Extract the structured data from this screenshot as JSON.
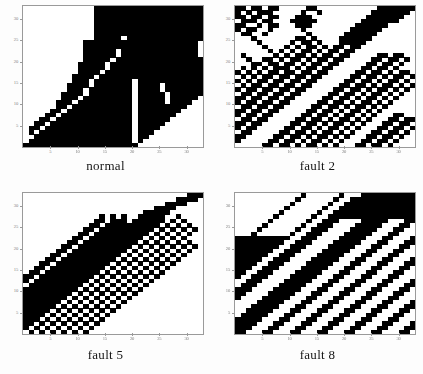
{
  "figure": {
    "name": "recurrence-plot-grid",
    "background": "#ffffff",
    "ink_color": "#000000",
    "axis_color": "#9a9a9a"
  },
  "panels": [
    {
      "caption": "normal",
      "key": "normal"
    },
    {
      "caption": "fault 2",
      "key": "fault2"
    },
    {
      "caption": "fault 5",
      "key": "fault5"
    },
    {
      "caption": "fault 8",
      "key": "fault8"
    }
  ],
  "axis": {
    "xticks": [
      5,
      10,
      15,
      20,
      25,
      30
    ],
    "yticks": [
      5,
      10,
      15,
      20,
      25,
      30
    ],
    "xlim": [
      0,
      33
    ],
    "ylim": [
      0,
      33
    ],
    "xlabel": "",
    "ylabel": "",
    "grid": false
  },
  "chart_data": [
    {
      "type": "heatmap",
      "title": "normal",
      "xlabel": "",
      "ylabel": "",
      "xlim": [
        0,
        33
      ],
      "ylim": [
        0,
        33
      ],
      "xticks": [
        5,
        10,
        15,
        20,
        25,
        30
      ],
      "yticks": [
        5,
        10,
        15,
        20,
        25,
        30
      ],
      "grid": false,
      "legend": "none",
      "colors": {
        "0": "#ffffff",
        "1": "#000000"
      },
      "nrows": 33,
      "ncols": 33,
      "matrix": [
        "000000000000011111111111111111111",
        "000000000000011111111111111111111",
        "000000000000011111111111111111111",
        "000000000000011111111111111111111",
        "000000000000011111111111111111111",
        "000000000000011111111111111111111",
        "000000000000011111111111111111111",
        "000000000000011111011111111111111",
        "000000000001111111111111111111110",
        "000000000001111111111111111111110",
        "000000000001111110111111111111110",
        "000000000001111110111111111111110",
        "000000000001111101111111111111111",
        "000000000011111011111111111111111",
        "000000000011111011111111111111111",
        "000000000011110111111111111111111",
        "000000000111101111111111111111111",
        "000000000111011111110111111111111",
        "000000001111011111110111101111111",
        "000000001110111111110111101111111",
        "000000011110111111110111110111111",
        "000000011101111111110111110111110",
        "000000111011111111110111110111100",
        "000000110111111111110111111111000",
        "000001101111111111110111111110000",
        "000011011111111111110111111100000",
        "000110111111111111110111111000000",
        "001101111111111111110111110000000",
        "011011111111111111110111100000000",
        "010111111111111111110111000000000",
        "001111111111111111110110000000000",
        "011111111111111111110100000000000",
        "111111111111111111111000000000000"
      ]
    },
    {
      "type": "heatmap",
      "title": "fault 2",
      "xlabel": "",
      "ylabel": "",
      "xlim": [
        0,
        33
      ],
      "ylim": [
        0,
        33
      ],
      "xticks": [
        5,
        10,
        15,
        20,
        25,
        30
      ],
      "yticks": [
        5,
        10,
        15,
        20,
        25,
        30
      ],
      "grid": false,
      "legend": "none",
      "colors": {
        "0": "#ffffff",
        "1": "#000000"
      },
      "nrows": 33,
      "ncols": 33,
      "matrix": [
        "110110110000011000000000001111111",
        "101011100000100100000000011111110",
        "110110110001110000000000111111100",
        "011101100011111000000001111111000",
        "110010110001110000000011111100000",
        "101100100000100000000111111000000",
        "011001000000010000001111110000000",
        "000100000001101000011111100000000",
        "000010000010110100011111000000000",
        "000001000101011010110110000000000",
        "000000101010110101101100000000000",
        "010000010101101011011000001101100",
        "001001101011010110110000011011010",
        "000110110110101101100000110110100",
        "010101011101011011000001101101000",
        "101010110110110110000011011010110",
        "010101101101101100000110110101101",
        "101011011011011000001101101011010",
        "010110110110110000011011010110101",
        "101101101101100000110110101101010",
        "011011011011000001101101011010100",
        "110110110110000011011010110101000",
        "101101101100000110110101101010000",
        "011011011000001101101011010100000",
        "110110110000011011010110101000000",
        "101101100000110110101101010001100",
        "011011000001101101011010100011011",
        "110110000011011010110101000110110",
        "101100000110110101101010001101101",
        "011000001101101011010100011011010",
        "110000011011010110101000110110100",
        "100000110110101101010001101101000",
        "000001101101011010100011011010000"
      ]
    },
    {
      "type": "heatmap",
      "title": "fault 5",
      "xlabel": "",
      "ylabel": "",
      "xlim": [
        0,
        33
      ],
      "ylim": [
        0,
        33
      ],
      "xticks": [
        5,
        10,
        15,
        20,
        25,
        30
      ],
      "yticks": [
        5,
        10,
        15,
        20,
        25,
        30
      ],
      "grid": false,
      "legend": "none",
      "colors": {
        "0": "#ffffff",
        "1": "#000000"
      },
      "nrows": 33,
      "ncols": 33,
      "matrix": [
        "000000000000000000000000000000111",
        "000000000000000000000000000011110",
        "000000000000000000000000001111000",
        "000000000000000000000000111100000",
        "000000000000000000000011111000000",
        "000000000000001010100111110010000",
        "000000000000011011101111110101000",
        "000000000000110111111111101010100",
        "000000000001101111111111010101010",
        "000000000011011111111110101010100",
        "000000000110111111111101010101000",
        "000000001101111111111010101010100",
        "000000011011111111110101010101010",
        "000000110111111111101010101010100",
        "000001101111111111010101010101000",
        "000011011111111110101010101010000",
        "000110111111111101010101010100000",
        "001101111111111010101010101000000",
        "011011111111110101010101010000000",
        "110111111111101010101010100000000",
        "101111111111010101010101000000000",
        "011111111110101010101010000000000",
        "111111111101010101010100000000000",
        "111111111010101010101000000000000",
        "111111110101010101010000000000000",
        "111111101010101010100000000000000",
        "111111010101010101000000000000000",
        "111110101010101010000000000000000",
        "111101010101010100000000000000000",
        "111010101010101000000000000000000",
        "110101010101010000000000000000000",
        "101010101010100000000000000000000",
        "010101010101000000000000000000000"
      ]
    },
    {
      "type": "heatmap",
      "title": "fault 8",
      "xlabel": "",
      "ylabel": "",
      "xlim": [
        0,
        33
      ],
      "ylim": [
        0,
        33
      ],
      "xticks": [
        5,
        10,
        15,
        20,
        25,
        30
      ],
      "yticks": [
        5,
        10,
        15,
        20,
        25,
        30
      ],
      "grid": false,
      "legend": "none",
      "colors": {
        "0": "#ffffff",
        "1": "#000000"
      },
      "nrows": 33,
      "ncols": 33,
      "matrix": [
        "000000000000100000010001111111111",
        "000000000001000000100111111111111",
        "000000000010000001001111111111111",
        "000000000100000010011111111111111",
        "000000001000000100111111111111111",
        "000000010000001001111111111111111",
        "000000100000010011100001111100011",
        "000001000000100111000011111000110",
        "000010000001001110000111110001100",
        "000100000010011100001111100011000",
        "111111111100111000011111000110001",
        "111111111001110000111110001100011",
        "111111110011100001111100011000110",
        "111111100111000011111000110001100",
        "111111001110000111110001100011000",
        "111110011100001111100011000110001",
        "111100111000011111000110001100011",
        "111001110000111110001100011000110",
        "110011100001111100011000110001100",
        "100111000011111000110001100011000",
        "001110000111110001100011000110001",
        "011100001111100011000110001100011",
        "111000011111000110001100011000110",
        "110000111110001100011000110001100",
        "100001111100011000110001100011000",
        "000011111000110001100011000110001",
        "000111110001100011000110001100011",
        "001111100011000110001100011000110",
        "011111000110001100011000110001100",
        "111110001100011000110001100011000",
        "111100011000110001100011000110001",
        "111000110001100011000110001100011",
        "110001100011000110001100011000110"
      ]
    }
  ]
}
